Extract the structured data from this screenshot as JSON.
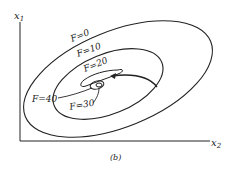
{
  "figure": {
    "caption": "(b)",
    "axes": {
      "y_label": "x",
      "y_sub": "1",
      "x_label": "x",
      "x_sub": "2"
    },
    "contours": [
      {
        "label_var": "F",
        "label_eq": "=",
        "label_val": "0"
      },
      {
        "label_var": "F",
        "label_eq": "=",
        "label_val": "10"
      },
      {
        "label_var": "F",
        "label_eq": "=",
        "label_val": "20"
      },
      {
        "label_var": "F",
        "label_eq": "=",
        "label_val": "30"
      },
      {
        "label_var": "F",
        "label_eq": "=",
        "label_val": "40"
      }
    ],
    "colors": {
      "stroke": "#222222",
      "background": "#ffffff"
    }
  }
}
